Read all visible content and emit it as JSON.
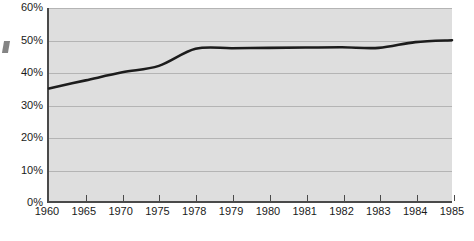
{
  "chart_data": {
    "type": "line",
    "title": "",
    "subtitle": "",
    "xlabel": "",
    "ylabel": "",
    "ylim": [
      0,
      60
    ],
    "yunit": "%",
    "grid": true,
    "legend": "none",
    "x_axis_note": "Tick marks are evenly spaced although the year intervals are unequal (5-year steps 1960-1975, then annual 1978-1985).",
    "ytick_labels": [
      "60%",
      "50%",
      "40%",
      "30%",
      "20%",
      "10%",
      "0%"
    ],
    "ytick_values": [
      60,
      50,
      40,
      30,
      20,
      10,
      0
    ],
    "xtick_labels": [
      "1960",
      "1965",
      "1970",
      "1975",
      "1978",
      "1979",
      "1980",
      "1981",
      "1982",
      "1983",
      "1984",
      "1985"
    ],
    "categories": [
      1960,
      1965,
      1970,
      1975,
      1978,
      1979,
      1980,
      1981,
      1982,
      1983,
      1984,
      1985
    ],
    "values": [
      35.0,
      37.5,
      40.0,
      42.0,
      47.3,
      47.5,
      47.6,
      47.7,
      47.8,
      47.6,
      49.4,
      50.0
    ],
    "series": [
      {
        "name": "",
        "color": "#1c1c1c",
        "values": [
          35.0,
          37.5,
          40.0,
          42.0,
          47.3,
          47.5,
          47.6,
          47.7,
          47.8,
          47.6,
          49.4,
          50.0
        ]
      }
    ],
    "plot_background": "#dedede",
    "gridline_color": "#b4b4b4",
    "axis_color": "#4a4a4a",
    "line_color": "#1c1c1c",
    "line_width": 2.6
  }
}
